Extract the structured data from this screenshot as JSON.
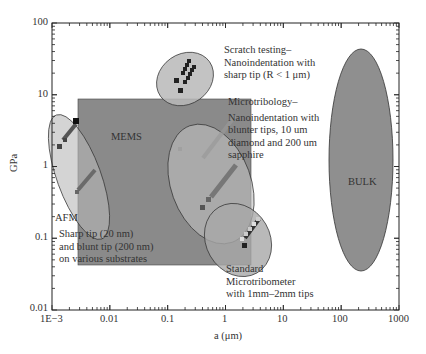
{
  "chart_data": {
    "type": "scatter",
    "title": "",
    "xlabel": "a (μm)",
    "ylabel": "GPa",
    "xscale": "log",
    "yscale": "log",
    "xlim": [
      0.001,
      1000
    ],
    "ylim": [
      0.01,
      100
    ],
    "x_ticks": [
      "1E−3",
      "0.01",
      "0.1",
      "1",
      "10",
      "100",
      "1000"
    ],
    "y_ticks": [
      "0.01",
      "0.1",
      "1",
      "10",
      "100"
    ],
    "grid": false,
    "regions": [
      {
        "name": "MEMS",
        "shape": "rectangle",
        "x_range": [
          0.003,
          3.0
        ],
        "y_range": [
          0.09,
          8.5
        ],
        "color": "#8a8a8a",
        "label": "MEMS"
      },
      {
        "name": "BULK",
        "shape": "ellipse",
        "x_range": [
          40,
          1000
        ],
        "y_range": [
          0.014,
          50
        ],
        "color": "#8f8f8f",
        "label": "BULK"
      },
      {
        "name": "Scratch testing",
        "shape": "ellipse",
        "x_range": [
          0.1,
          1.0
        ],
        "y_range": [
          6,
          45
        ],
        "color": "#b5b5b5",
        "label": "Scratch testing– Nanoindentation with sharp tip (R < 1 μm)"
      },
      {
        "name": "Microtribology",
        "shape": "ellipse",
        "x_range": [
          0.2,
          3.0
        ],
        "y_range": [
          0.3,
          7
        ],
        "color": "#b5b5b5",
        "label": "Microtribology– Nanoindentation with blunter tips, 10 um diamond and 200 um sapphire"
      },
      {
        "name": "AFM",
        "shape": "ellipse",
        "x_range": [
          0.0012,
          0.012
        ],
        "y_range": [
          0.15,
          5
        ],
        "color": "#b5b5b5",
        "label": "AFM Sharp tip (20 nm) and blunt tip (200 nm) on various substrates"
      },
      {
        "name": "Standard Microtribometer",
        "shape": "ellipse",
        "x_range": [
          0.6,
          4.0
        ],
        "y_range": [
          0.03,
          0.35
        ],
        "color": "#b5b5b5",
        "label": "Standard Microtribometer with 1mm–2mm tips"
      }
    ],
    "series": [
      {
        "name": "Scratch testing points",
        "marker": "square",
        "color": "#222222",
        "x": [
          0.18,
          0.2,
          0.22,
          0.24,
          0.25,
          0.27,
          0.28,
          0.3,
          0.31,
          0.16
        ],
        "y": [
          11.5,
          13.5,
          16,
          19,
          22,
          25,
          28,
          31,
          34,
          16
        ]
      },
      {
        "name": "AFM points",
        "marker": "square",
        "color": "#333333",
        "x": [
          0.0014,
          0.0018,
          0.002,
          0.0022,
          0.0025,
          0.0028,
          0.003,
          0.0032
        ],
        "y": [
          2.0,
          2.5,
          2.8,
          3.1,
          3.4,
          3.7,
          4.0,
          4.2
        ]
      },
      {
        "name": "MEMS/AFM diagonal points",
        "marker": "square",
        "color": "#555555",
        "x": [
          0.003,
          0.0035,
          0.004,
          0.0045,
          0.005,
          0.0055,
          0.006
        ],
        "y": [
          0.45,
          0.55,
          0.65,
          0.75,
          0.85,
          0.95,
          1.05
        ]
      },
      {
        "name": "Microtribology points",
        "marker": "square",
        "color": "#555555",
        "x": [
          0.35,
          0.4,
          0.45,
          0.5,
          0.55,
          0.6,
          0.65,
          0.7,
          0.3
        ],
        "y": [
          0.4,
          0.5,
          0.6,
          0.75,
          0.9,
          1.1,
          1.3,
          1.5,
          0.3
        ]
      },
      {
        "name": "Microtribometer points",
        "marker": "square",
        "color": "#333333",
        "x": [
          1.2,
          1.4,
          1.6,
          1.8,
          2.0,
          2.2,
          2.4,
          1.3
        ],
        "y": [
          0.12,
          0.14,
          0.16,
          0.18,
          0.2,
          0.22,
          0.25,
          0.09
        ]
      }
    ],
    "annotations": [
      {
        "text": "MEMS",
        "x": 0.01,
        "y": 3.0
      },
      {
        "text": "BULK",
        "x": 200,
        "y": 0.9
      },
      {
        "text": "AFM",
        "x": 0.0012,
        "y": 0.18
      }
    ]
  },
  "labels": {
    "y_axis": "GPa",
    "x_axis": "a (μm)",
    "y_ticks": [
      "100",
      "10",
      "1",
      "0.1",
      "0.01"
    ],
    "x_ticks": [
      "1E−3",
      "0.01",
      "0.1",
      "1",
      "10",
      "100",
      "1000"
    ],
    "mems": "MEMS",
    "bulk": "BULK",
    "afm": "AFM",
    "afm_desc": [
      "Sharp tip (20 nm)",
      "and blunt tip (200 nm)",
      "on various substrates"
    ],
    "scratch": [
      "Scratch testing–",
      "Nanoindentation with",
      "sharp tip (R < 1 μm)"
    ],
    "microtribology": [
      "Microtribology–",
      "Nanoindentation with",
      "blunter tips, 10 um",
      "diamond and 200 um",
      "sapphire"
    ],
    "microtribometer": [
      "Standard",
      "Microtribometer",
      "with 1mm–2mm tips"
    ]
  }
}
